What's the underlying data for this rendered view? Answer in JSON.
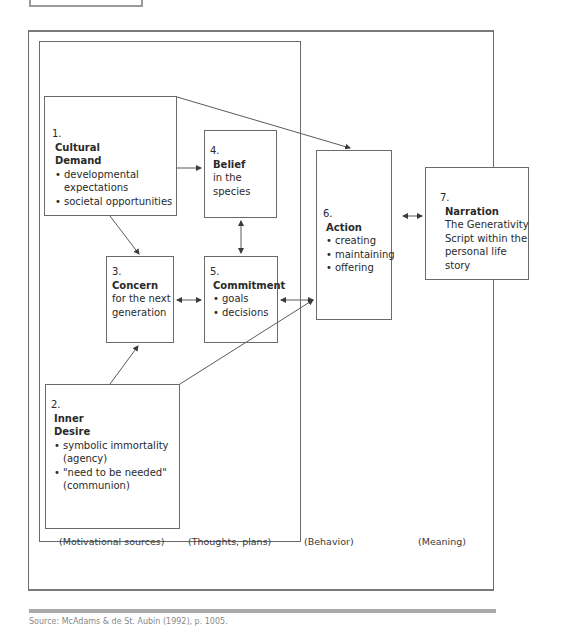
{
  "diagram": {
    "boxes": [
      {
        "id": "cultural-demand",
        "number": "1.",
        "title_line1": "Cultural",
        "title_line2": "Demand",
        "bullets": [
          "developmental expectations",
          "societal opportunities"
        ]
      },
      {
        "id": "inner-desire",
        "number": "2.",
        "title_line1": "Inner",
        "title_line2": "Desire",
        "bullets": [
          "symbolic immortality (agency)",
          "\"need to be needed\" (communion)"
        ]
      },
      {
        "id": "concern",
        "number": "3.",
        "title": "Concern",
        "text_line1": "for the next",
        "text_line2": "generation"
      },
      {
        "id": "belief",
        "number": "4.",
        "title": "Belief",
        "text": "in the species"
      },
      {
        "id": "commitment",
        "number": "5.",
        "title": "Commitment",
        "bullets": [
          "goals",
          "decisions"
        ]
      },
      {
        "id": "action",
        "number": "6.",
        "title": "Action",
        "bullets": [
          "creating",
          "maintaining",
          "offering"
        ]
      },
      {
        "id": "narration",
        "number": "7.",
        "title": "Narration",
        "text_line1": "The Generativity",
        "text_line2": "Script within the",
        "text_line3": "personal life story"
      }
    ],
    "column_labels": [
      "(Motivational sources)",
      "(Thoughts, plans)",
      "(Behavior)",
      "(Meaning)"
    ],
    "edges": [
      {
        "from": "cultural-demand",
        "to": "belief",
        "type": "arrow"
      },
      {
        "from": "cultural-demand",
        "to": "concern",
        "type": "arrow"
      },
      {
        "from": "cultural-demand",
        "to": "action",
        "type": "arrow"
      },
      {
        "from": "inner-desire",
        "to": "concern",
        "type": "arrow"
      },
      {
        "from": "inner-desire",
        "to": "action",
        "type": "arrow"
      },
      {
        "from": "belief",
        "to": "commitment",
        "type": "bidirectional"
      },
      {
        "from": "concern",
        "to": "commitment",
        "type": "bidirectional"
      },
      {
        "from": "commitment",
        "to": "action",
        "type": "bidirectional"
      },
      {
        "from": "action",
        "to": "narration",
        "type": "bidirectional"
      }
    ],
    "footer_text": "Source: McAdams & de St. Aubin (1992), p. 1005."
  },
  "colors": {
    "line": "#5a5a5a",
    "frame": "#6b6b6b",
    "footer_rule": "#a9a9a9"
  }
}
